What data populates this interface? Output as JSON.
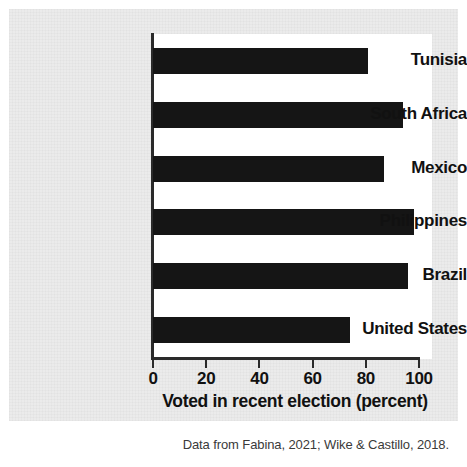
{
  "chart_data": {
    "type": "bar",
    "orientation": "horizontal",
    "title": "",
    "xlabel": "Voted in recent election (percent)",
    "ylabel": "",
    "categories": [
      "Tunisia",
      "South Africa",
      "Mexico",
      "Philippines",
      "Brazil",
      "United States"
    ],
    "values": [
      81,
      94,
      87,
      98,
      96,
      74
    ],
    "xlim": [
      0,
      100
    ],
    "xticks": [
      0,
      20,
      40,
      60,
      80,
      100
    ],
    "xtick_labels": [
      "0",
      "20",
      "40",
      "60",
      "80",
      "100"
    ],
    "grid": false,
    "legend": false,
    "bar_color": "#151515",
    "plot_background": "#ffffff",
    "figure_background": "#ebebeb"
  },
  "caption": {
    "text": "Data from Fabina, 2021; Wike & Castillo, 2018."
  }
}
